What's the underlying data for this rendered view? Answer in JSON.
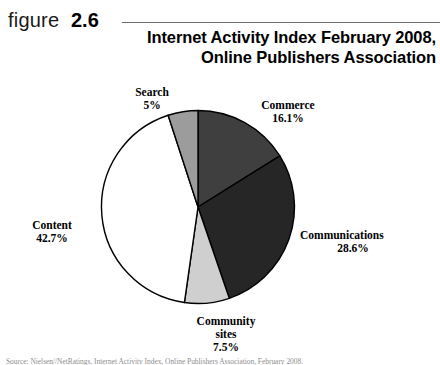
{
  "figure": {
    "label_word": "figure",
    "number": "2.6"
  },
  "chart_title": {
    "line1": "Internet Activity Index February 2008,",
    "line2": "Online Publishers Association"
  },
  "source_caption": "Source: Nielsen//NetRatings, Internet Activity Index, Online Publishers Association, February 2008.",
  "chart_data": {
    "type": "pie",
    "title": "Internet Activity Index February 2008, Online Publishers Association",
    "xlabel": "",
    "ylabel": "",
    "legend_position": "none",
    "grid": false,
    "start_angle_deg": 0,
    "direction": "clockwise",
    "categories": [
      "Commerce",
      "Communications",
      "Community sites",
      "Content",
      "Search"
    ],
    "values": [
      16.1,
      28.6,
      7.5,
      42.7,
      5.0
    ],
    "value_labels": [
      "16.1%",
      "28.6%",
      "7.5%",
      "42.7%",
      "5%"
    ],
    "colors": [
      "#3f3f3f",
      "#262626",
      "#cfcfcf",
      "#ffffff",
      "#9c9c9c"
    ],
    "stroke_color": "#000000",
    "slices": [
      {
        "name": "Commerce",
        "value": 16.1,
        "value_label": "16.1%",
        "color": "#3f3f3f"
      },
      {
        "name": "Communications",
        "value": 28.6,
        "value_label": "28.6%",
        "color": "#262626"
      },
      {
        "name": "Community sites",
        "value": 7.5,
        "value_label": "7.5%",
        "color": "#cfcfcf"
      },
      {
        "name": "Content",
        "value": 42.7,
        "value_label": "42.7%",
        "color": "#ffffff"
      },
      {
        "name": "Search",
        "value": 5.0,
        "value_label": "5%",
        "color": "#9c9c9c"
      }
    ]
  },
  "labels": {
    "search": {
      "name": "Search",
      "pct": "5%"
    },
    "commerce": {
      "name": "Commerce",
      "pct": "16.1%"
    },
    "communications": {
      "name": "Communications",
      "pct": "28.6%"
    },
    "content": {
      "name": "Content",
      "pct": "42.7%"
    },
    "community": {
      "name": "Community",
      "name2": "sites",
      "pct": "7.5%"
    }
  }
}
